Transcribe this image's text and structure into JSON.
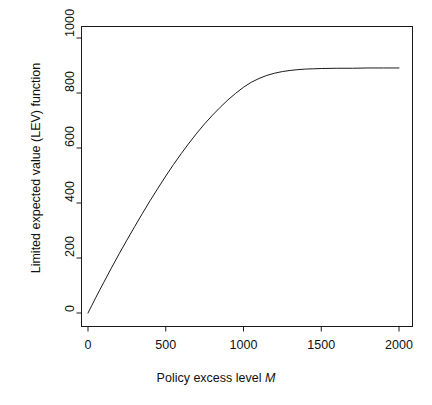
{
  "chart_data": {
    "type": "line",
    "title": "",
    "xlabel": "Policy excess level M",
    "xlabel_plain": "Policy excess level ",
    "xlabel_italic": "M",
    "ylabel": "Limited expected value (LEV) function",
    "xlim": [
      -40,
      2060
    ],
    "ylim": [
      -30,
      1040
    ],
    "xticks": [
      0,
      500,
      1000,
      1500,
      2000
    ],
    "xtick_labels": [
      "0",
      "500",
      "1000",
      "1500",
      "2000"
    ],
    "yticks": [
      0,
      200,
      400,
      600,
      800,
      1000
    ],
    "ytick_labels": [
      "0",
      "200",
      "400",
      "600",
      "800",
      "1000"
    ],
    "grid": false,
    "legend": null,
    "frame": true,
    "line_color": "#1a1a1a",
    "line_width": 1,
    "series": [
      {
        "name": "LEV function",
        "x": [
          0,
          25,
          50,
          75,
          100,
          150,
          200,
          250,
          300,
          350,
          400,
          450,
          500,
          550,
          600,
          650,
          700,
          750,
          800,
          850,
          900,
          950,
          1000,
          1050,
          1100,
          1150,
          1200,
          1250,
          1300,
          1350,
          1400,
          1450,
          1500,
          1600,
          1700,
          1800,
          1900,
          2000
        ],
        "values": [
          0,
          28,
          56,
          83,
          110,
          163,
          215,
          265,
          314,
          362,
          409,
          454,
          498,
          540,
          580,
          618,
          654,
          688,
          719,
          748,
          775,
          799,
          821,
          839,
          853,
          864,
          872,
          878,
          882,
          885,
          887,
          888,
          889,
          890,
          890,
          891,
          891,
          891
        ]
      }
    ],
    "annotations": []
  }
}
